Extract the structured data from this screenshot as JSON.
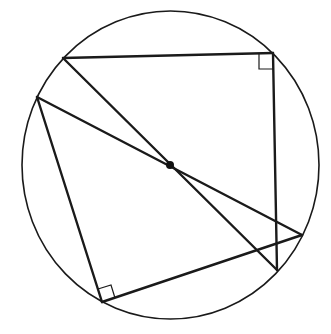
{
  "diagram": {
    "title": "",
    "colors": {
      "stroke": "#1a1a1a",
      "background": "#ffffff"
    },
    "circle": {
      "cx": 170.5,
      "cy": 165,
      "rx": 148.5,
      "ry": 154
    },
    "center": {
      "label": "",
      "x": 170,
      "y": 165,
      "r": 4
    },
    "points": {
      "A": {
        "x": 63,
        "y": 58
      },
      "B": {
        "x": 273,
        "y": 53
      },
      "C": {
        "x": 37,
        "y": 97
      },
      "D": {
        "x": 102,
        "y": 302
      },
      "E": {
        "x": 302,
        "y": 235
      },
      "F": {
        "x": 277,
        "y": 270
      }
    },
    "segments": [
      {
        "name": "A-B",
        "from": "A",
        "to": "B"
      },
      {
        "name": "B-F",
        "from": "B",
        "to": "F"
      },
      {
        "name": "A-F",
        "from": "A",
        "to": "F"
      },
      {
        "name": "C-E",
        "from": "C",
        "to": "E"
      },
      {
        "name": "C-D",
        "from": "C",
        "to": "D"
      },
      {
        "name": "D-E",
        "from": "D",
        "to": "E"
      }
    ],
    "right_angle_markers": [
      {
        "at": "B",
        "points": "259,53 259,69 274,69"
      },
      {
        "at": "D",
        "points": "98,289 111,285 115,298"
      }
    ]
  }
}
